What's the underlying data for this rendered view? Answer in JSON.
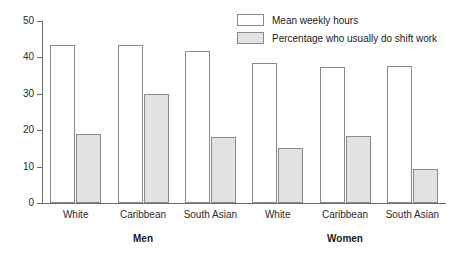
{
  "chart_data": {
    "type": "bar",
    "title": "",
    "subtitle": "",
    "xlabel": "",
    "ylabel": "",
    "grid": false,
    "legend_position": "top-right",
    "ylim": [
      0,
      50
    ],
    "yticks": [
      0,
      10,
      20,
      30,
      40,
      50
    ],
    "ytick_labels": [
      "0",
      "10",
      "20",
      "30",
      "40",
      "50"
    ],
    "categories": [
      "White",
      "Caribbean",
      "South Asian",
      "White",
      "Caribbean",
      "South Asian"
    ],
    "groups": [
      {
        "label": "Men",
        "categories": [
          "White",
          "Caribbean",
          "South Asian"
        ]
      },
      {
        "label": "Women",
        "categories": [
          "White",
          "Caribbean",
          "South Asian"
        ]
      }
    ],
    "series": [
      {
        "name": "Mean weekly hours",
        "fill": "#ffffff",
        "edge": "#8a8a8a",
        "values": [
          43.5,
          43.3,
          41.7,
          38.6,
          37.4,
          37.7
        ]
      },
      {
        "name": "Percentage who usually do shift work",
        "fill": "#e2e2e2",
        "edge": "#8a8a8a",
        "values": [
          19.0,
          30.0,
          18.2,
          15.2,
          18.4,
          9.3
        ]
      }
    ]
  },
  "legend": {
    "items": [
      {
        "label": "Mean weekly hours",
        "style": "open"
      },
      {
        "label": "Percentage who usually do shift work",
        "style": "shaded"
      }
    ]
  },
  "axis": {
    "y_ticks": [
      "50",
      "40",
      "30",
      "20",
      "10",
      "0"
    ]
  },
  "colors": {
    "axis": "#6b6b6b",
    "bar_edge": "#8a8a8a",
    "bar_open_fill": "#ffffff",
    "bar_shaded_fill": "#e2e2e2",
    "text": "#1a1a1a"
  }
}
